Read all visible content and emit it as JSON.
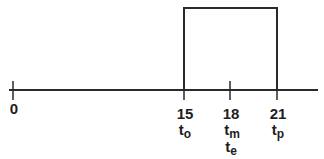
{
  "diagram": {
    "type": "timeline-pulse",
    "axis": {
      "ticks": [
        {
          "value": "0",
          "x": 13
        },
        {
          "value": "15",
          "x": 184
        },
        {
          "value": "18",
          "x": 230
        },
        {
          "value": "21",
          "x": 277
        }
      ]
    },
    "pulse": {
      "start": "15",
      "end": "21"
    },
    "symbols": [
      {
        "base": "t",
        "sub": "o",
        "at": "15"
      },
      {
        "base": "t",
        "sub": "m",
        "at": "18"
      },
      {
        "base": "t",
        "sub": "e",
        "at": "18"
      },
      {
        "base": "t",
        "sub": "p",
        "at": "21"
      }
    ],
    "colors": {
      "line": "#2a2a2a",
      "text": "#1e1e1e",
      "background": "#ffffff"
    }
  }
}
